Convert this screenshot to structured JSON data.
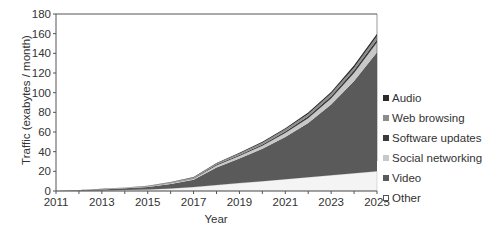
{
  "chart_data": {
    "type": "area",
    "stacked": true,
    "title": "",
    "xlabel": "Year",
    "ylabel": "Traffic (exabytes / month)",
    "xlim": [
      2011,
      2025
    ],
    "ylim": [
      0,
      180
    ],
    "x_ticks": [
      2011,
      2013,
      2015,
      2017,
      2019,
      2021,
      2023,
      2025
    ],
    "y_ticks": [
      0,
      20,
      40,
      60,
      80,
      100,
      120,
      140,
      160,
      180
    ],
    "legend_position": "right",
    "x": [
      2011,
      2012,
      2013,
      2014,
      2015,
      2016,
      2017,
      2018,
      2019,
      2020,
      2021,
      2022,
      2023,
      2024,
      2025
    ],
    "series": [
      {
        "name": "Other",
        "color": "#f4f4f4",
        "values": [
          0,
          0.3,
          0.6,
          1,
          1.5,
          2.5,
          4,
          6,
          8,
          10,
          12,
          14,
          16,
          18,
          20
        ]
      },
      {
        "name": "Video",
        "color": "#5a5a5a",
        "values": [
          0,
          0.4,
          1,
          1.7,
          2.5,
          4.5,
          7.5,
          18,
          25,
          33,
          43,
          55,
          72,
          94,
          121
        ]
      },
      {
        "name": "Social networking",
        "color": "#c8c8c8",
        "values": [
          0,
          0.1,
          0.2,
          0.3,
          0.5,
          0.8,
          1,
          2,
          2.5,
          3,
          4,
          5,
          6,
          8,
          10
        ]
      },
      {
        "name": "Software updates",
        "color": "#3a3a3a",
        "values": [
          0,
          0.05,
          0.1,
          0.15,
          0.25,
          0.4,
          0.5,
          0.8,
          1,
          1.2,
          1.6,
          2,
          2.3,
          2.7,
          3
        ]
      },
      {
        "name": "Web browsing",
        "color": "#8c8c8c",
        "values": [
          0,
          0.1,
          0.2,
          0.3,
          0.4,
          0.6,
          0.8,
          1.2,
          1.5,
          1.8,
          2.1,
          2.4,
          2.7,
          3,
          3.5
        ]
      },
      {
        "name": "Audio",
        "color": "#2a2a2a",
        "values": [
          0,
          0.05,
          0.1,
          0.15,
          0.2,
          0.3,
          0.4,
          0.6,
          0.8,
          1,
          1.2,
          1.5,
          1.8,
          2.2,
          2.5
        ]
      }
    ]
  },
  "legend": {
    "items": [
      {
        "label": "Audio",
        "color": "#2a2a2a"
      },
      {
        "label": "Web browsing",
        "color": "#8c8c8c"
      },
      {
        "label": "Software updates",
        "color": "#3a3a3a"
      },
      {
        "label": "Social networking",
        "color": "#c8c8c8"
      },
      {
        "label": "Video",
        "color": "#5a5a5a"
      },
      {
        "label": "Other",
        "color": "#ffffff"
      }
    ]
  },
  "axes": {
    "xlabel": "Year",
    "ylabel": "Traffic (exabytes / month)"
  }
}
